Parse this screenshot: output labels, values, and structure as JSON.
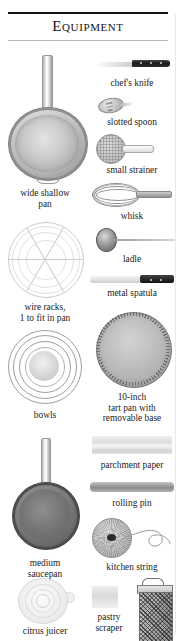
{
  "header": {
    "title": "Equipment"
  },
  "items": [
    {
      "id": "wide-shallow-pan",
      "label": "wide shallow\npan",
      "icon": "skillet-icon"
    },
    {
      "id": "chefs-knife",
      "label": "chef's knife",
      "icon": "chefs-knife-icon"
    },
    {
      "id": "slotted-spoon",
      "label": "slotted spoon",
      "icon": "slotted-spoon-icon"
    },
    {
      "id": "small-strainer",
      "label": "small strainer",
      "icon": "strainer-icon"
    },
    {
      "id": "whisk",
      "label": "whisk",
      "icon": "whisk-icon"
    },
    {
      "id": "ladle",
      "label": "ladle",
      "icon": "ladle-icon"
    },
    {
      "id": "metal-spatula",
      "label": "metal spatula",
      "icon": "spatula-icon"
    },
    {
      "id": "wire-racks",
      "label": "wire racks,\n1 to fit in pan",
      "icon": "wire-rack-icon"
    },
    {
      "id": "tart-pan",
      "label": "10-inch\ntart pan with\nremovable base",
      "icon": "tart-pan-icon"
    },
    {
      "id": "bowls",
      "label": "bowls",
      "icon": "nested-bowls-icon"
    },
    {
      "id": "parchment-paper",
      "label": "parchment paper",
      "icon": "parchment-icon"
    },
    {
      "id": "rolling-pin",
      "label": "rolling pin",
      "icon": "rolling-pin-icon"
    },
    {
      "id": "medium-saucepan",
      "label": "medium\nsaucepan",
      "icon": "saucepan-icon"
    },
    {
      "id": "kitchen-string",
      "label": "kitchen string",
      "icon": "string-ball-icon"
    },
    {
      "id": "citrus-juicer",
      "label": "citrus juicer",
      "icon": "citrus-juicer-icon"
    },
    {
      "id": "pastry-scraper",
      "label": "pastry\nscraper",
      "icon": "pastry-scraper-icon"
    },
    {
      "id": "box-grater",
      "label": "",
      "icon": "box-grater-icon"
    }
  ],
  "colors": {
    "page_background": "#ffffff",
    "text": "#1d1d1d",
    "rule_dark": "#111111",
    "rule_light": "#b9b9b9",
    "metal_light": "#e3e3e3",
    "metal_mid": "#b4b4b4",
    "metal_dark": "#8a8a8a",
    "handle_black": "#1a1a1a"
  }
}
